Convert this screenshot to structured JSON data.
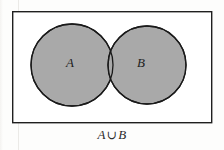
{
  "figure": {
    "type": "venn-diagram",
    "title": "",
    "caption": {
      "left_operand": "A",
      "operator": "∪",
      "right_operand": "B",
      "full": "A ∪ B"
    },
    "universe_box": {
      "name": "universal-set-rectangle",
      "x": 12,
      "y": 11,
      "width": 200,
      "height": 112,
      "stroke": "#1f1f1f",
      "stroke_width": 1.4,
      "fill": "#ffffff"
    },
    "sets": [
      {
        "label": "A",
        "name": "set-a-circle",
        "cx": 72,
        "cy": 65,
        "r": 41,
        "fill": "#a9a9a9",
        "stroke": "#1a1a1a",
        "label_x": 70,
        "label_y": 67,
        "shaded": true
      },
      {
        "label": "B",
        "name": "set-b-circle",
        "cx": 147,
        "cy": 65,
        "r": 39,
        "fill": "#a9a9a9",
        "stroke": "#1a1a1a",
        "label_x": 141,
        "label_y": 67,
        "shaded": true
      }
    ],
    "shading": {
      "region": "union",
      "description": "Both circles entirely shaded including the intersection",
      "color": "#a9a9a9"
    },
    "colors": {
      "background": "#fdfdfc",
      "shade_gray": "#a9a9a9",
      "ink": "#1a1a1a",
      "box_fill": "#ffffff"
    }
  }
}
